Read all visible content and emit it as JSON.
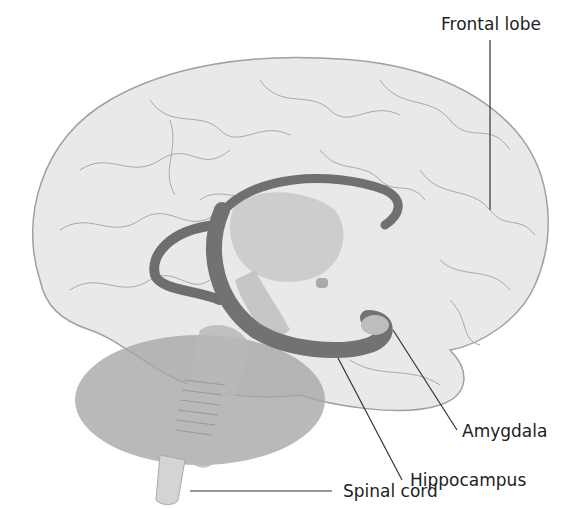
{
  "labels": {
    "frontal_lobe": "Frontal lobe",
    "amygdala": "Amygdala",
    "hippocampus": "Hippocampus",
    "spinal_cord": "Spinal cord"
  },
  "colors": {
    "cortex_fill": "#e8e8e8",
    "cortex_stroke": "#9a9a9a",
    "limbic_dark": "#707070",
    "inner_fill": "#c4c4c4",
    "cerebellum_fill": "#a8a8a8",
    "brainstem_fill": "#b4b4b4",
    "leader_line": "#333333"
  }
}
